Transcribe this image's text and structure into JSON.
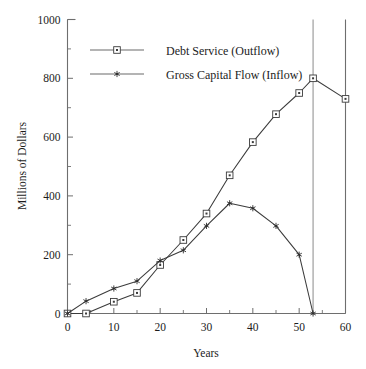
{
  "chart_data": {
    "type": "line",
    "title": "",
    "xlabel": "Years",
    "ylabel": "Millions of Dollars",
    "xlim": [
      0,
      60
    ],
    "ylim": [
      0,
      1000
    ],
    "grid": false,
    "legend_position": "top-left",
    "x_ticks": [
      0,
      10,
      20,
      30,
      40,
      50,
      60
    ],
    "x_tick_labels": [
      "0",
      "10",
      "20",
      "30",
      "40",
      "50",
      "60"
    ],
    "x_minor_ticks": [
      5,
      15,
      25,
      35,
      45,
      55
    ],
    "y_ticks": [
      0,
      200,
      400,
      600,
      800,
      1000
    ],
    "y_tick_labels": [
      "0",
      "200",
      "400",
      "600",
      "800",
      "1000"
    ],
    "y_minor_ticks": [
      100,
      300,
      500,
      700,
      900
    ],
    "annotations": [
      {
        "name": "crossover-year-53",
        "type": "vertical-line",
        "x": 53
      }
    ],
    "series": [
      {
        "name": "Debt Service (Outflow)",
        "marker": "square",
        "x": [
          0,
          4,
          10,
          15,
          20,
          25,
          30,
          35,
          40,
          45,
          50,
          53,
          60
        ],
        "values": [
          0,
          0,
          40,
          70,
          165,
          250,
          340,
          470,
          583,
          678,
          750,
          800,
          730
        ]
      },
      {
        "name": "Gross Capital Flow (Inflow)",
        "marker": "star",
        "x": [
          0,
          4,
          10,
          15,
          20,
          25,
          30,
          35,
          40,
          45,
          50,
          53
        ],
        "values": [
          0,
          42,
          85,
          110,
          180,
          215,
          298,
          375,
          358,
          298,
          200,
          0
        ]
      }
    ]
  },
  "legend": {
    "items": [
      {
        "label": "Debt Service (Outflow)",
        "marker": "square"
      },
      {
        "label": "Gross Capital Flow (Inflow)",
        "marker": "star"
      }
    ]
  },
  "colors": {
    "axis": "#6e6e6e",
    "series_line": "#3b3b3b",
    "reference_line": "#8a8a8a",
    "background": "#ffffff",
    "text": "#1c1c1c"
  }
}
